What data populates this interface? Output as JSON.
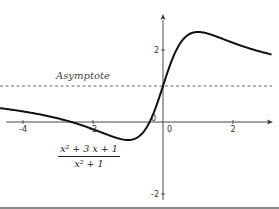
{
  "chart_data": {
    "type": "line",
    "title": "",
    "function": "(x^2 + 3x + 1) / (x^2 + 1)",
    "formula": {
      "numerator": "x² + 3 x + 1",
      "denominator": "x² + 1"
    },
    "xlabel": "",
    "ylabel": "",
    "xlim": [
      -4.66,
      3.1
    ],
    "ylim": [
      -2.4,
      3.4
    ],
    "x_ticks": [
      {
        "value": -4,
        "label": "-4"
      },
      {
        "value": -2,
        "label": "-2"
      },
      {
        "value": 0,
        "label": "0"
      },
      {
        "value": 2,
        "label": "2"
      }
    ],
    "y_ticks": [
      {
        "value": 2,
        "label": "2"
      },
      {
        "value": -2,
        "label": "-2"
      }
    ],
    "origin_label": "0",
    "series": [
      {
        "name": "f(x)",
        "x": [
          -4.66,
          -4,
          -3,
          -2,
          -1.5,
          -1,
          -0.5,
          0,
          0.5,
          1,
          1.5,
          2,
          2.5,
          3.1
        ],
        "y": [
          0.42,
          0.29,
          0.1,
          -0.2,
          -0.38,
          -0.5,
          -0.2,
          1.0,
          2.2,
          2.5,
          2.38,
          2.2,
          2.03,
          1.86
        ]
      }
    ],
    "asymptote": {
      "type": "horizontal",
      "y": 1,
      "style": "dashed",
      "label": "Asymptote"
    },
    "extrema": [
      {
        "type": "max",
        "x": 1,
        "y": 2.5
      },
      {
        "type": "min",
        "x": -1,
        "y": -0.5
      }
    ],
    "grid": false,
    "legend": null
  }
}
